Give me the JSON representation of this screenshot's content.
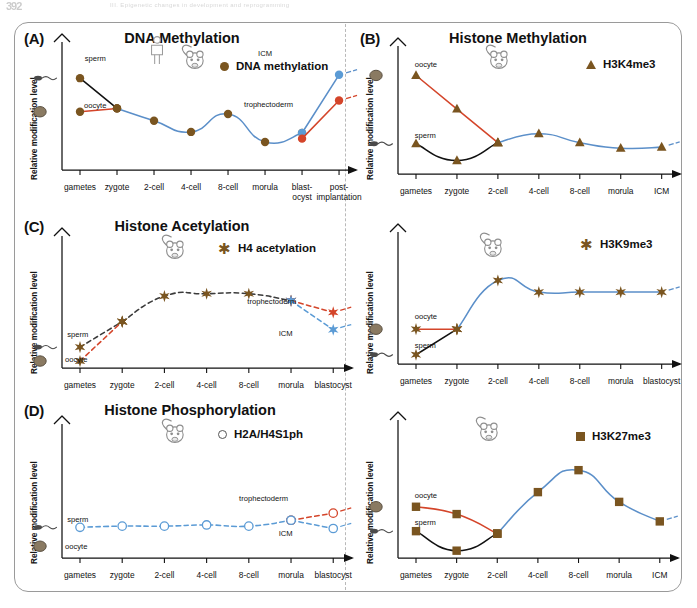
{
  "page_artifact": {
    "page_number": "392",
    "running_head": "III. Epigenetic changes in development and reprogramming"
  },
  "figure": {
    "divider_style": "vertical-dashed",
    "frame_style": "rounded-rectangle"
  },
  "colors": {
    "brown": "#7a5520",
    "dark_brown": "#5d3f16",
    "orange": "#e8a838",
    "red": "#d4452a",
    "blue": "#5b8fc9",
    "black": "#111111",
    "green": "#4a9a55",
    "icm_blue": "#5b9bd5",
    "troph_red": "#d4452a",
    "open_circle_gray": "#555555",
    "oocyte_fill": "#8a7a62",
    "sperm_gray": "#3b3b3b"
  },
  "chart_data": [
    {
      "id": "panel-a",
      "panel_tag": "(A)",
      "title": "DNA Methylation",
      "type": "line",
      "ylabel": "Relative modification level",
      "xlabel": "",
      "grid": false,
      "species_icons": [
        "human",
        "mouse"
      ],
      "legend": {
        "position": "top-right",
        "entries": [
          {
            "label": "DNA methylation",
            "marker": "circle",
            "color": "#7a5520"
          }
        ]
      },
      "categories": [
        "gametes",
        "zygote",
        "2-cell",
        "4-cell",
        "8-cell",
        "morula",
        "blast-ocyst",
        "post-implantation"
      ],
      "xticklabels": [
        "gametes",
        "zygote",
        "2-cell",
        "4-cell",
        "8-cell",
        "morula",
        "blast-\nocyst",
        "post-\nimplantation"
      ],
      "ylim": [
        0,
        100
      ],
      "annotations": [
        "sperm",
        "oocyte",
        "ICM",
        "trophectoderm"
      ],
      "series": [
        {
          "name": "sperm",
          "color": "#111111",
          "style": "solid",
          "marker": "circle",
          "x": [
            "gametes",
            "zygote"
          ],
          "values": [
            82,
            55
          ]
        },
        {
          "name": "oocyte",
          "color": "#d4452a",
          "style": "solid",
          "marker": "circle",
          "x": [
            "gametes",
            "zygote"
          ],
          "values": [
            52,
            55
          ]
        },
        {
          "name": "embryo",
          "color": "#5b8fc9",
          "style": "solid",
          "marker": "circle",
          "x": [
            "zygote",
            "2-cell",
            "4-cell",
            "8-cell",
            "morula",
            "blast-ocyst"
          ],
          "values": [
            55,
            44,
            34,
            50,
            25,
            33
          ]
        },
        {
          "name": "ICM",
          "color": "#5b8fc9",
          "style": "solid",
          "marker": "circle",
          "x": [
            "blast-ocyst",
            "post-implantation"
          ],
          "values": [
            33,
            85
          ]
        },
        {
          "name": "trophectoderm",
          "color": "#d4452a",
          "style": "solid",
          "marker": "circle",
          "x": [
            "blast-ocyst",
            "post-implantation"
          ],
          "values": [
            28,
            62
          ]
        }
      ]
    },
    {
      "id": "panel-b",
      "panel_tag": "(B)",
      "title": "Histone Methylation",
      "type": "line",
      "ylabel": "Relative modification level",
      "xlabel": "",
      "grid": false,
      "species_icons": [
        "mouse"
      ],
      "legend": {
        "position": "top-right",
        "entries": [
          {
            "label": "H3K4me3",
            "marker": "triangle",
            "color": "#7a5520"
          }
        ]
      },
      "categories": [
        "gametes",
        "zygote",
        "2-cell",
        "4-cell",
        "8-cell",
        "morula",
        "ICM"
      ],
      "xticklabels": [
        "gametes",
        "zygote",
        "2-cell",
        "4-cell",
        "8-cell",
        "morula",
        "ICM"
      ],
      "ylim": [
        0,
        100
      ],
      "annotations": [
        "oocyte",
        "sperm"
      ],
      "series": [
        {
          "name": "oocyte",
          "color": "#d4452a",
          "style": "solid",
          "marker": "triangle",
          "x": [
            "gametes",
            "zygote",
            "2-cell"
          ],
          "values": [
            88,
            58,
            28
          ]
        },
        {
          "name": "sperm",
          "color": "#111111",
          "style": "solid",
          "marker": "triangle",
          "x": [
            "gametes",
            "zygote",
            "2-cell"
          ],
          "values": [
            27,
            12,
            28
          ]
        },
        {
          "name": "embryo",
          "color": "#5b8fc9",
          "style": "solid",
          "marker": "triangle",
          "x": [
            "2-cell",
            "4-cell",
            "8-cell",
            "morula",
            "ICM"
          ],
          "values": [
            28,
            36,
            28,
            23,
            24
          ]
        }
      ]
    },
    {
      "id": "panel-c",
      "panel_tag": "(C)",
      "title": "Histone Acetylation",
      "type": "line",
      "ylabel": "Relative modification level",
      "xlabel": "",
      "grid": false,
      "species_icons": [
        "mouse"
      ],
      "legend": {
        "position": "top-right",
        "entries": [
          {
            "label": "H4 acetylation",
            "marker": "star",
            "color": "#7a5520"
          }
        ]
      },
      "categories": [
        "gametes",
        "zygote",
        "2-cell",
        "4-cell",
        "8-cell",
        "morula",
        "blastocyst"
      ],
      "xticklabels": [
        "gametes",
        "zygote",
        "2-cell",
        "4-cell",
        "8-cell",
        "morula",
        "blastocyst"
      ],
      "ylim": [
        0,
        100
      ],
      "annotations": [
        "sperm",
        "oocyte",
        "trophectoderm",
        "ICM"
      ],
      "series": [
        {
          "name": "sperm",
          "color": "#3b3b3b",
          "style": "dashed",
          "marker": "star",
          "x": [
            "gametes",
            "zygote"
          ],
          "values": [
            18,
            40
          ]
        },
        {
          "name": "oocyte",
          "color": "#d4452a",
          "style": "dashed",
          "marker": "star",
          "x": [
            "gametes",
            "zygote"
          ],
          "values": [
            6,
            40
          ]
        },
        {
          "name": "embryo",
          "color": "#3b3b3b",
          "style": "dashed",
          "marker": "star",
          "x": [
            "zygote",
            "2-cell",
            "4-cell",
            "8-cell",
            "morula"
          ],
          "values": [
            40,
            62,
            64,
            64,
            58
          ]
        },
        {
          "name": "trophectoderm",
          "color": "#d4452a",
          "style": "dashed",
          "marker": "star",
          "x": [
            "morula",
            "blastocyst"
          ],
          "values": [
            58,
            48
          ]
        },
        {
          "name": "ICM",
          "color": "#5b9bd5",
          "style": "dashed",
          "marker": "star",
          "x": [
            "morula",
            "blastocyst"
          ],
          "values": [
            58,
            33
          ]
        }
      ]
    },
    {
      "id": "panel-d",
      "panel_tag": "(D)",
      "title": "Histone Phosphorylation",
      "type": "line",
      "ylabel": "Relative modification level",
      "xlabel": "",
      "grid": false,
      "species_icons": [
        "mouse"
      ],
      "legend": {
        "position": "top-right",
        "entries": [
          {
            "label": "H2A/H4S1ph",
            "marker": "circle-open",
            "color": "#555555"
          }
        ]
      },
      "categories": [
        "gametes",
        "zygote",
        "2-cell",
        "4-cell",
        "8-cell",
        "morula",
        "blastocyst"
      ],
      "xticklabels": [
        "gametes",
        "zygote",
        "2-cell",
        "4-cell",
        "8-cell",
        "morula",
        "blastocyst"
      ],
      "ylim": [
        0,
        100
      ],
      "annotations": [
        "sperm",
        "oocyte",
        "trophectoderm",
        "ICM"
      ],
      "series": [
        {
          "name": "embryo",
          "color": "#5b9bd5",
          "style": "dashed",
          "marker": "circle-open",
          "x": [
            "gametes",
            "zygote",
            "2-cell",
            "4-cell",
            "8-cell",
            "morula"
          ],
          "values": [
            26,
            27,
            27,
            28,
            27,
            32
          ]
        },
        {
          "name": "trophectoderm",
          "color": "#d4452a",
          "style": "dashed",
          "marker": "circle-open",
          "x": [
            "morula",
            "blastocyst"
          ],
          "values": [
            32,
            38
          ]
        },
        {
          "name": "ICM",
          "color": "#5b9bd5",
          "style": "dashed",
          "marker": "circle-open",
          "x": [
            "morula",
            "blastocyst"
          ],
          "values": [
            32,
            25
          ]
        }
      ]
    },
    {
      "id": "panel-e",
      "panel_tag": "",
      "title": "",
      "type": "line",
      "ylabel": "Relative modification level",
      "xlabel": "",
      "grid": false,
      "species_icons": [
        "mouse"
      ],
      "legend": {
        "position": "top-right",
        "entries": [
          {
            "label": "H3K9me3",
            "marker": "star",
            "color": "#7a5520"
          }
        ]
      },
      "categories": [
        "gametes",
        "zygote",
        "2-cell",
        "4-cell",
        "8-cell",
        "morula",
        "blastocyst"
      ],
      "xticklabels": [
        "gametes",
        "zygote",
        "2-cell",
        "4-cell",
        "8-cell",
        "morula",
        "blastocyst"
      ],
      "ylim": [
        0,
        100
      ],
      "annotations": [
        "oocyte",
        "sperm"
      ],
      "series": [
        {
          "name": "oocyte",
          "color": "#d4452a",
          "style": "solid",
          "marker": "star",
          "x": [
            "gametes",
            "zygote"
          ],
          "values": [
            30,
            30
          ]
        },
        {
          "name": "sperm",
          "color": "#111111",
          "style": "solid",
          "marker": "star",
          "x": [
            "gametes",
            "zygote"
          ],
          "values": [
            8,
            30
          ]
        },
        {
          "name": "embryo",
          "color": "#5b8fc9",
          "style": "solid",
          "marker": "star",
          "x": [
            "zygote",
            "2-cell",
            "4-cell",
            "8-cell",
            "morula",
            "blastocyst"
          ],
          "values": [
            30,
            72,
            62,
            62,
            62,
            62
          ]
        }
      ]
    },
    {
      "id": "panel-f",
      "panel_tag": "",
      "title": "",
      "type": "line",
      "ylabel": "Relative modification level",
      "xlabel": "",
      "grid": false,
      "species_icons": [
        "mouse"
      ],
      "legend": {
        "position": "top-right",
        "entries": [
          {
            "label": "H3K27me3",
            "marker": "square",
            "color": "#7a5520"
          }
        ]
      },
      "categories": [
        "gametes",
        "zygote",
        "2-cell",
        "4-cell",
        "8-cell",
        "morula",
        "ICM"
      ],
      "xticklabels": [
        "gametes",
        "zygote",
        "2-cell",
        "4-cell",
        "8-cell",
        "morula",
        "ICM"
      ],
      "ylim": [
        0,
        100
      ],
      "annotations": [
        "oocyte",
        "sperm"
      ],
      "series": [
        {
          "name": "oocyte",
          "color": "#d4452a",
          "style": "solid",
          "marker": "square",
          "x": [
            "gametes",
            "zygote",
            "2-cell"
          ],
          "values": [
            42,
            36,
            20
          ]
        },
        {
          "name": "sperm",
          "color": "#111111",
          "style": "solid",
          "marker": "square",
          "x": [
            "gametes",
            "zygote",
            "2-cell"
          ],
          "values": [
            22,
            6,
            20
          ]
        },
        {
          "name": "embryo",
          "color": "#5b8fc9",
          "style": "solid",
          "marker": "square",
          "x": [
            "2-cell",
            "4-cell",
            "8-cell",
            "morula",
            "ICM"
          ],
          "values": [
            20,
            54,
            72,
            46,
            30
          ]
        }
      ]
    }
  ]
}
